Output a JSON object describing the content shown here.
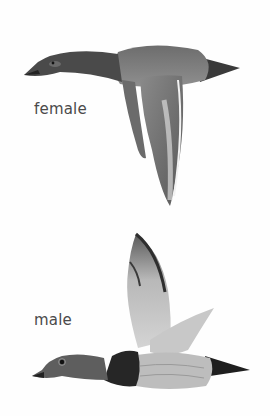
{
  "illustration": {
    "subject": "duck species in flight, female and male",
    "labels": {
      "female": "female",
      "male": "male"
    },
    "colors": {
      "background": "#fefefe",
      "label_text": "#4a4a4a",
      "dark_plumage": "#2e2e2e",
      "mid_plumage": "#7a7a7a",
      "light_plumage": "#c4c4c4"
    }
  }
}
